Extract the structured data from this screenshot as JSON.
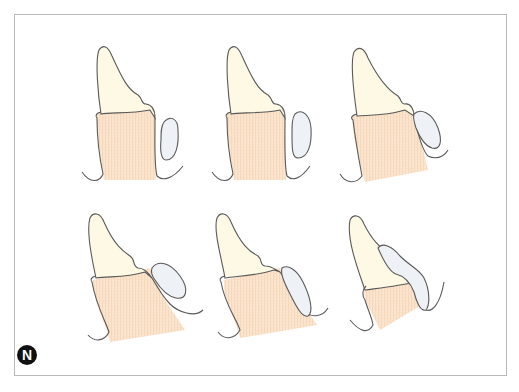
{
  "figure": {
    "label": "N",
    "panels": [
      {
        "id": 1,
        "row": 1,
        "col": 1,
        "description": "tooth with lip separated"
      },
      {
        "id": 2,
        "row": 1,
        "col": 2,
        "description": "tooth with lip separated"
      },
      {
        "id": 3,
        "row": 1,
        "col": 3,
        "description": "tooth tilted, lip touching"
      },
      {
        "id": 4,
        "row": 2,
        "col": 1,
        "description": "tooth tilted, lip overlapping"
      },
      {
        "id": 5,
        "row": 2,
        "col": 2,
        "description": "tooth tilted further, lip pressed"
      },
      {
        "id": 6,
        "row": 2,
        "col": 3,
        "description": "tooth inclined, lip draped over crown"
      }
    ]
  },
  "colors": {
    "crown": "#fdf9e4",
    "root": "#f8dcc0",
    "lip": "#eef1f6",
    "outline": "#5a5a5a",
    "frame": "#b9b9b9",
    "badge": "#111111"
  }
}
